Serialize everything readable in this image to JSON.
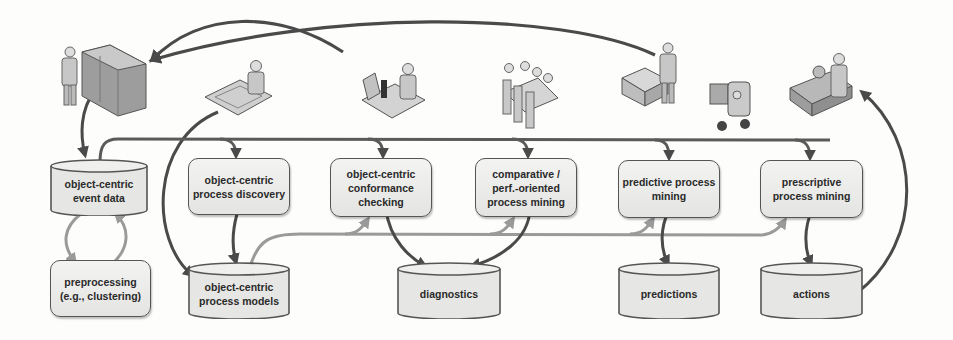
{
  "diagram": {
    "type": "flowchart",
    "nodes": [
      {
        "id": "event-data",
        "label": "object-centric\nevent data",
        "line1": "object-centric",
        "line2": "event data",
        "shape": "cylinder"
      },
      {
        "id": "discovery",
        "label": "object-centric process discovery",
        "line1": "object-centric",
        "line2": "process discovery",
        "shape": "rounded-box"
      },
      {
        "id": "conformance",
        "label": "object-centric conformance checking",
        "line1": "object-centric",
        "line2": "conformance",
        "line3": "checking",
        "shape": "rounded-box"
      },
      {
        "id": "comparative",
        "label": "comparative / perf.-oriented process mining",
        "line1": "comparative /",
        "line2": "perf.-oriented",
        "line3": "process mining",
        "shape": "rounded-box"
      },
      {
        "id": "predictive",
        "label": "predictive process mining",
        "line1": "predictive process",
        "line2": "mining",
        "shape": "rounded-box"
      },
      {
        "id": "prescriptive",
        "label": "prescriptive process mining",
        "line1": "prescriptive",
        "line2": "process mining",
        "shape": "rounded-box"
      },
      {
        "id": "preprocessing",
        "label": "preprocessing (e.g., clustering)",
        "line1": "preprocessing",
        "line2": "(e.g., clustering)",
        "shape": "rounded-box"
      },
      {
        "id": "process-models",
        "label": "object-centric process models",
        "line1": "object-centric",
        "line2": "process models",
        "shape": "cylinder"
      },
      {
        "id": "diagnostics",
        "label": "diagnostics",
        "line1": "diagnostics",
        "shape": "cylinder"
      },
      {
        "id": "predictions",
        "label": "predictions",
        "line1": "predictions",
        "shape": "cylinder"
      },
      {
        "id": "actions",
        "label": "actions",
        "line1": "actions",
        "shape": "cylinder"
      }
    ],
    "icons": [
      {
        "id": "data-center",
        "semantic": "person-with-server-rack-icon"
      },
      {
        "id": "modeler",
        "semantic": "person-with-blueprint-icon"
      },
      {
        "id": "analyst",
        "semantic": "person-with-microscope-icon"
      },
      {
        "id": "meeting",
        "semantic": "meeting-table-people-icon"
      },
      {
        "id": "packer",
        "semantic": "person-packing-boxes-icon"
      },
      {
        "id": "forklift",
        "semantic": "forklift-icon"
      },
      {
        "id": "operator",
        "semantic": "person-at-machine-icon"
      }
    ],
    "edges": [
      {
        "from": "data-center",
        "to": "event-data",
        "style": "dark"
      },
      {
        "from": "event-data",
        "to": "discovery",
        "style": "dark-bus"
      },
      {
        "from": "event-data",
        "to": "conformance",
        "style": "dark-bus"
      },
      {
        "from": "event-data",
        "to": "comparative",
        "style": "dark-bus"
      },
      {
        "from": "event-data",
        "to": "predictive",
        "style": "dark-bus"
      },
      {
        "from": "event-data",
        "to": "prescriptive",
        "style": "dark-bus"
      },
      {
        "from": "event-data",
        "to": "preprocessing",
        "style": "gray"
      },
      {
        "from": "preprocessing",
        "to": "event-data",
        "style": "gray"
      },
      {
        "from": "discovery",
        "to": "process-models",
        "style": "dark"
      },
      {
        "from": "modeler",
        "to": "process-models",
        "style": "dark"
      },
      {
        "from": "process-models",
        "to": "conformance",
        "style": "gray-bus"
      },
      {
        "from": "process-models",
        "to": "comparative",
        "style": "gray-bus"
      },
      {
        "from": "process-models",
        "to": "predictive",
        "style": "gray-bus"
      },
      {
        "from": "process-models",
        "to": "prescriptive",
        "style": "gray-bus"
      },
      {
        "from": "conformance",
        "to": "diagnostics",
        "style": "dark"
      },
      {
        "from": "comparative",
        "to": "diagnostics",
        "style": "dark"
      },
      {
        "from": "predictive",
        "to": "predictions",
        "style": "dark"
      },
      {
        "from": "prescriptive",
        "to": "actions",
        "style": "dark"
      },
      {
        "from": "actions",
        "to": "operator",
        "style": "dark"
      },
      {
        "from": "packer",
        "to": "data-center",
        "style": "dark"
      }
    ],
    "colors": {
      "dark_arrow": "#4a4a4a",
      "gray_arrow": "#9a9a9a",
      "node_fill": "#ebebe9",
      "node_border": "#555555",
      "text": "#2a2a2a"
    }
  }
}
